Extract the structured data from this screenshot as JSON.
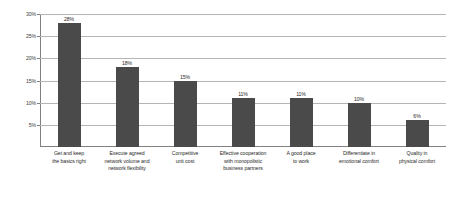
{
  "chart_data": {
    "type": "bar",
    "title": "",
    "subtitle": "",
    "xlabel": "",
    "ylabel": "",
    "ylim": [
      0,
      30
    ],
    "grid": true,
    "legend": false,
    "legend_position": "none",
    "orientation": "vertical",
    "bar_color": "#4a4a4a",
    "gridline_color": "#b4b4b4",
    "axis_color": "#808080",
    "background_color": "#ffffff",
    "value_suffix": "%",
    "yticks": [
      {
        "value": 30,
        "label": "30%"
      },
      {
        "value": 25,
        "label": "25%"
      },
      {
        "value": 20,
        "label": "20%"
      },
      {
        "value": 15,
        "label": "15%"
      },
      {
        "value": 10,
        "label": "10%"
      },
      {
        "value": 5,
        "label": "5%"
      }
    ],
    "categories": [
      "Get and keep\nthe basics right",
      "Execute agreed\nnetwork volume and\nnetwork flexibility",
      "Competitive\nunit cost",
      "Effective cooperation\nwith monopolistic\nbusiness partners",
      "A good place\nto work",
      "Differentiate in\nemotional comfort",
      "Quality in\nphysical comfort"
    ],
    "values": [
      28,
      18,
      15,
      11,
      11,
      10,
      6
    ],
    "value_labels": [
      "28%",
      "18%",
      "15%",
      "11%",
      "11%",
      "10%",
      "6%"
    ],
    "points": [
      {
        "category": "Get and keep the basics right",
        "value": 28,
        "label": "28%"
      },
      {
        "category": "Execute agreed network volume and network flexibility",
        "value": 18,
        "label": "18%"
      },
      {
        "category": "Competitive unit cost",
        "value": 15,
        "label": "15%"
      },
      {
        "category": "Effective cooperation with monopolistic business partners",
        "value": 11,
        "label": "11%"
      },
      {
        "category": "A good place to work",
        "value": 11,
        "label": "11%"
      },
      {
        "category": "Differentiate in emotional comfort",
        "value": 10,
        "label": "10%"
      },
      {
        "category": "Quality in physical comfort",
        "value": 6,
        "label": "6%"
      }
    ]
  }
}
